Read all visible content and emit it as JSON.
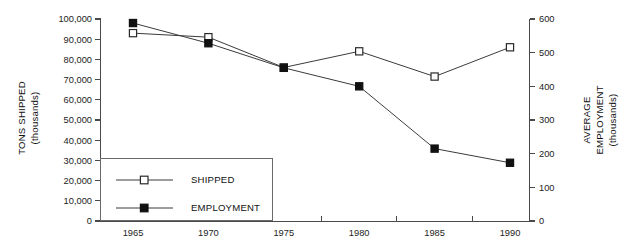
{
  "chart_data": {
    "type": "line",
    "title": "",
    "categories": [
      1965,
      1970,
      1975,
      1980,
      1985,
      1990
    ],
    "x": [
      1965,
      1970,
      1975,
      1980,
      1985,
      1990
    ],
    "xlabel": "",
    "grid": false,
    "legend_position": "inside-bottom-left",
    "series": [
      {
        "name": "SHIPPED",
        "axis": "left",
        "marker": "open-square",
        "values": [
          93000,
          91000,
          76000,
          84000,
          71500,
          86000
        ]
      },
      {
        "name": "EMPLOYMENT",
        "axis": "right",
        "marker": "filled-square",
        "values": [
          588,
          528,
          455,
          400,
          215,
          173
        ]
      }
    ],
    "axes": {
      "left": {
        "label_line1": "TONS SHIPPED",
        "label_line2": "(thousands)",
        "ylim": [
          0,
          100000
        ],
        "tick_values": [
          0,
          10000,
          20000,
          30000,
          40000,
          50000,
          60000,
          70000,
          80000,
          90000,
          100000
        ],
        "tick_labels": [
          "0",
          "10,000",
          "20,000",
          "30,000",
          "40,000",
          "50,000",
          "60,000",
          "70,000",
          "80,000",
          "90,000",
          "100,000"
        ]
      },
      "right": {
        "label_line1": "AVERAGE",
        "label_line2": "EMPLOYMENT",
        "label_line3": "(thousands)",
        "ylim": [
          0,
          600
        ],
        "tick_values": [
          0,
          100,
          200,
          300,
          400,
          500,
          600
        ],
        "tick_labels": [
          "0",
          "100",
          "200",
          "300",
          "400",
          "500",
          "600"
        ]
      },
      "bottom": {
        "tick_labels": [
          "1965",
          "1970",
          "1975",
          "1980",
          "1985",
          "1990"
        ]
      }
    },
    "legend": {
      "entries": [
        {
          "label": "SHIPPED",
          "marker": "open-square"
        },
        {
          "label": "EMPLOYMENT",
          "marker": "filled-square"
        }
      ]
    },
    "colors": {
      "line": "#3b3b3b",
      "axis": "#4a4a4a",
      "text": "#111111",
      "background": "#ffffff",
      "marker_fill": "#111111",
      "marker_open_fill": "#ffffff"
    }
  }
}
